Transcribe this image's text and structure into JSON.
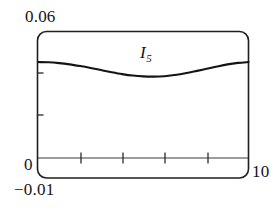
{
  "chart_data": {
    "type": "line",
    "title": "",
    "subtitle": "",
    "xlabel": "",
    "ylabel": "",
    "series_label": "I",
    "series_subscript": "5",
    "legend_position": "inline-above-curve",
    "grid": false,
    "xlim": [
      0,
      10
    ],
    "ylim": [
      -0.01,
      0.06
    ],
    "y_tick_labels": [
      "0.06",
      "0",
      "-0.01"
    ],
    "x_tick_labels": [
      "10"
    ],
    "x_tick_count": 4,
    "y_tick_count": 2,
    "x": [
      0.0,
      0.5,
      1.0,
      1.5,
      2.0,
      2.5,
      3.0,
      3.5,
      4.0,
      4.5,
      5.0,
      5.5,
      6.0,
      6.5,
      7.0,
      7.5,
      8.0,
      8.5,
      9.0,
      9.5,
      10.0
    ],
    "y": [
      0.0455,
      0.0454,
      0.045,
      0.0444,
      0.0436,
      0.0427,
      0.0417,
      0.0407,
      0.0398,
      0.0391,
      0.0387,
      0.0386,
      0.0388,
      0.0394,
      0.0402,
      0.0412,
      0.0423,
      0.0434,
      0.0444,
      0.0451,
      0.0455
    ],
    "series": [
      {
        "name": "I5",
        "values": [
          0.0455,
          0.0454,
          0.045,
          0.0444,
          0.0436,
          0.0427,
          0.0417,
          0.0407,
          0.0398,
          0.0391,
          0.0387,
          0.0386,
          0.0388,
          0.0394,
          0.0402,
          0.0412,
          0.0423,
          0.0434,
          0.0444,
          0.0451,
          0.0455
        ]
      }
    ]
  },
  "figure": {
    "labels": {
      "y_max": "0.06",
      "y_zero": "0",
      "y_bottom": "−0.01",
      "x_max": "10"
    },
    "curve": {
      "symbol": "I",
      "subscript": "5"
    }
  },
  "colors": {
    "background": "#ffffff",
    "frame": "#1f1f1f",
    "curve": "#141414",
    "axis": "#333333",
    "text": "#141414"
  }
}
